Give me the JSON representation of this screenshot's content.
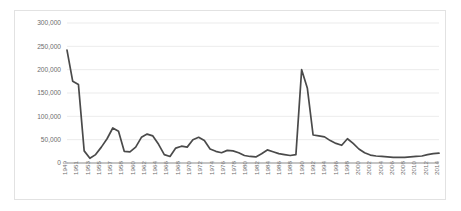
{
  "chart_data": {
    "type": "line",
    "title": "",
    "xlabel": "",
    "ylabel": "",
    "ylim": [
      0,
      300000
    ],
    "yticks": [
      0,
      50000,
      100000,
      150000,
      200000,
      250000,
      300000
    ],
    "ytick_labels": [
      "0",
      "50,000",
      "100,000",
      "150,000",
      "200,000",
      "250,000",
      "300,000"
    ],
    "grid": true,
    "legend": "none",
    "xtick_labels": [
      "1949",
      "1951",
      "1953",
      "1955",
      "1957",
      "1958",
      "1960",
      "1962",
      "1964",
      "1966",
      "1968",
      "1970",
      "1972",
      "1974",
      "1976",
      "1978",
      "1980",
      "1982",
      "1984",
      "1986",
      "1988",
      "1990",
      "1992",
      "1994",
      "1996",
      "1998",
      "2000",
      "2002",
      "2004",
      "2006",
      "2008",
      "2010",
      "2012",
      "2014"
    ],
    "x": [
      1949,
      1950,
      1951,
      1952,
      1953,
      1954,
      1955,
      1956,
      1957,
      1958,
      1959,
      1960,
      1961,
      1962,
      1963,
      1964,
      1965,
      1966,
      1967,
      1968,
      1969,
      1970,
      1971,
      1972,
      1973,
      1974,
      1975,
      1976,
      1977,
      1978,
      1979,
      1980,
      1981,
      1982,
      1983,
      1984,
      1985,
      1986,
      1987,
      1988,
      1989,
      1990,
      1991,
      1992,
      1993,
      1994,
      1995,
      1996,
      1997,
      1998,
      1999,
      2000,
      2001,
      2002,
      2003,
      2004,
      2005,
      2006,
      2007,
      2008,
      2009,
      2010,
      2011,
      2012,
      2013,
      2014
    ],
    "values": [
      242000,
      175000,
      168000,
      26000,
      10000,
      18000,
      34000,
      52000,
      75000,
      68000,
      25000,
      24000,
      34000,
      55000,
      62000,
      58000,
      40000,
      18000,
      14000,
      32000,
      36000,
      34000,
      50000,
      55000,
      48000,
      30000,
      25000,
      22000,
      27000,
      26000,
      22000,
      16000,
      14000,
      13000,
      20000,
      28000,
      24000,
      20000,
      18000,
      16000,
      18000,
      200000,
      160000,
      60000,
      58000,
      56000,
      48000,
      42000,
      38000,
      52000,
      42000,
      30000,
      22000,
      17000,
      15000,
      14000,
      13000,
      12000,
      12000,
      12000,
      13000,
      14000,
      15000,
      18000,
      20000,
      21000
    ],
    "series_name": "value",
    "line_color": "#4a4a4a",
    "grid_color": "#e6e6e6",
    "axis_color": "#8c8c8c",
    "tick_color": "#6d6d6d",
    "background": "#ffffff"
  }
}
